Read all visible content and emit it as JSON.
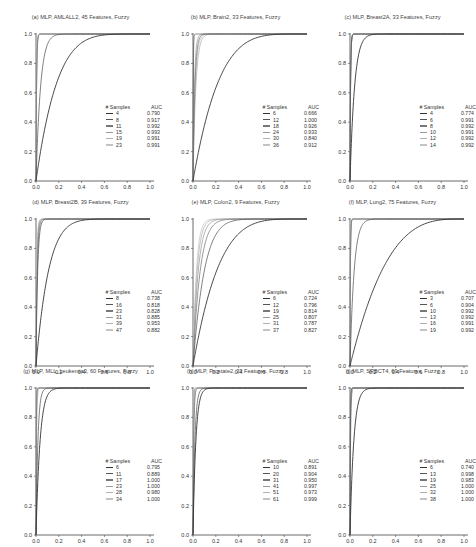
{
  "chart_data": [
    {
      "type": "line",
      "title": "(a) MLP, AMLALL2, 45 Features, Fuzzy",
      "xlabel": "",
      "ylabel": "",
      "xlim": [
        0,
        1
      ],
      "ylim": [
        0,
        1
      ],
      "xticks": [
        "0.0",
        "0.2",
        "0.4",
        "0.6",
        "0.8",
        "1.0"
      ],
      "yticks": [
        "0.0",
        "0.2",
        "0.4",
        "0.6",
        "0.8",
        "1.0"
      ],
      "grid": false,
      "legend_position": "lower right",
      "legend_header": {
        "samples": "# Samples",
        "auc": "AUC"
      },
      "series": [
        {
          "name": "4",
          "auc": "0.790",
          "k": 5.5
        },
        {
          "name": "8",
          "auc": "0.917",
          "k": 25
        },
        {
          "name": "11",
          "auc": "0.992",
          "k": 200
        },
        {
          "name": "15",
          "auc": "0.993",
          "k": 220
        },
        {
          "name": "19",
          "auc": "0.991",
          "k": 210
        },
        {
          "name": "23",
          "auc": "0.991",
          "k": 210
        }
      ]
    },
    {
      "type": "line",
      "title": "(b) MLP, Brain2, 33 Features, Fuzzy",
      "xlabel": "",
      "ylabel": "",
      "xlim": [
        0,
        1
      ],
      "ylim": [
        0,
        1
      ],
      "xticks": [
        "0.0",
        "0.2",
        "0.4",
        "0.6",
        "0.8",
        "1.0"
      ],
      "yticks": [
        "0.0",
        "0.2",
        "0.4",
        "0.6",
        "0.8",
        "1.0"
      ],
      "grid": false,
      "legend_position": "lower right",
      "legend_header": {
        "samples": "# Samples",
        "auc": "AUC"
      },
      "series": [
        {
          "name": "6",
          "auc": "0.666",
          "k": 4.5
        },
        {
          "name": "12",
          "auc": "1.000",
          "k": 400
        },
        {
          "name": "18",
          "auc": "0.926",
          "k": 60
        },
        {
          "name": "24",
          "auc": "0.933",
          "k": 80
        },
        {
          "name": "30",
          "auc": "0.840",
          "k": 40
        },
        {
          "name": "36",
          "auc": "0.912",
          "k": 50
        }
      ]
    },
    {
      "type": "line",
      "title": "(c) MLP, Breast2A, 33 Features, Fuzzy",
      "xlabel": "",
      "ylabel": "",
      "xlim": [
        0,
        1
      ],
      "ylim": [
        0,
        1
      ],
      "xticks": [
        "0.0",
        "0.2",
        "0.4",
        "0.6",
        "0.8",
        "1.0"
      ],
      "yticks": [
        "0.0",
        "0.2",
        "0.4",
        "0.6",
        "0.8",
        "1.0"
      ],
      "grid": false,
      "legend_position": "lower right",
      "legend_header": {
        "samples": "# Samples",
        "auc": "AUC"
      },
      "series": [
        {
          "name": "4",
          "auc": "0.774",
          "k": 25
        },
        {
          "name": "6",
          "auc": "0.991",
          "k": 210
        },
        {
          "name": "8",
          "auc": "0.992",
          "k": 220
        },
        {
          "name": "10",
          "auc": "0.991",
          "k": 210
        },
        {
          "name": "12",
          "auc": "0.992",
          "k": 220
        },
        {
          "name": "14",
          "auc": "0.992",
          "k": 220
        }
      ]
    },
    {
      "type": "line",
      "title": "(d) MLP, Breast2B, 39 Features, Fuzzy",
      "xlabel": "",
      "ylabel": "",
      "xlim": [
        0,
        1
      ],
      "ylim": [
        0,
        1
      ],
      "xticks": [
        "0.0",
        "0.2",
        "0.4",
        "0.6",
        "0.8",
        "1.0"
      ],
      "yticks": [
        "0.0",
        "0.2",
        "0.4",
        "0.6",
        "0.8",
        "1.0"
      ],
      "grid": false,
      "legend_position": "lower right",
      "legend_header": {
        "samples": "# Samples",
        "auc": "AUC"
      },
      "series": [
        {
          "name": "8",
          "auc": "0.738",
          "k": 9
        },
        {
          "name": "16",
          "auc": "0.818",
          "k": 70
        },
        {
          "name": "23",
          "auc": "0.828",
          "k": 90
        },
        {
          "name": "31",
          "auc": "0.885",
          "k": 110
        },
        {
          "name": "39",
          "auc": "0.953",
          "k": 130
        },
        {
          "name": "47",
          "auc": "0.882",
          "k": 150
        }
      ]
    },
    {
      "type": "line",
      "title": "(e) MLP, Colon2, 9 Features, Fuzzy",
      "xlabel": "",
      "ylabel": "",
      "xlim": [
        0,
        1
      ],
      "ylim": [
        0,
        1
      ],
      "xticks": [
        "0.0",
        "0.2",
        "0.4",
        "0.6",
        "0.8",
        "1.0"
      ],
      "yticks": [
        "0.0",
        "0.2",
        "0.4",
        "0.6",
        "0.8",
        "1.0"
      ],
      "grid": false,
      "legend_position": "lower right",
      "legend_header": {
        "samples": "# Samples",
        "auc": "AUC"
      },
      "series": [
        {
          "name": "6",
          "auc": "0.724",
          "k": 4.5
        },
        {
          "name": "12",
          "auc": "0.796",
          "k": 10
        },
        {
          "name": "19",
          "auc": "0.814",
          "k": 16
        },
        {
          "name": "25",
          "auc": "0.807",
          "k": 22
        },
        {
          "name": "31",
          "auc": "0.787",
          "k": 28
        },
        {
          "name": "37",
          "auc": "0.827",
          "k": 34
        }
      ]
    },
    {
      "type": "line",
      "title": "(f) MLP, Lung2, 75 Features, Fuzzy",
      "xlabel": "",
      "ylabel": "",
      "xlim": [
        0,
        1
      ],
      "ylim": [
        0,
        1
      ],
      "xticks": [
        "0.0",
        "0.2",
        "0.4",
        "0.6",
        "0.8",
        "1.0"
      ],
      "yticks": [
        "0.0",
        "0.2",
        "0.4",
        "0.6",
        "0.8",
        "1.0"
      ],
      "grid": false,
      "legend_position": "lower right",
      "legend_header": {
        "samples": "# Samples",
        "auc": "AUC"
      },
      "series": [
        {
          "name": "3",
          "auc": "0.707",
          "k": 3.2
        },
        {
          "name": "6",
          "auc": "0.904",
          "k": 28
        },
        {
          "name": "10",
          "auc": "0.992",
          "k": 300
        },
        {
          "name": "13",
          "auc": "0.992",
          "k": 300
        },
        {
          "name": "16",
          "auc": "0.991",
          "k": 290
        },
        {
          "name": "19",
          "auc": "0.992",
          "k": 300
        }
      ]
    },
    {
      "type": "line",
      "title": "(g) MLP, MLL_Leukemia3, 60 Features, Fuzzy",
      "xlabel": "",
      "ylabel": "",
      "xlim": [
        0,
        1
      ],
      "ylim": [
        0,
        1
      ],
      "xticks": [
        "0.0",
        "0.2",
        "0.4",
        "0.6",
        "0.8",
        "1.0"
      ],
      "yticks": [
        "0.0",
        "0.2",
        "0.4",
        "0.6",
        "0.8",
        "1.0"
      ],
      "grid": false,
      "legend_position": "lower right",
      "legend_header": {
        "samples": "# Samples",
        "auc": "AUC"
      },
      "series": [
        {
          "name": "6",
          "auc": "0.795",
          "k": 28
        },
        {
          "name": "11",
          "auc": "0.889",
          "k": 60
        },
        {
          "name": "17",
          "auc": "1.000",
          "k": 400
        },
        {
          "name": "23",
          "auc": "1.000",
          "k": 400
        },
        {
          "name": "28",
          "auc": "0.980",
          "k": 200
        },
        {
          "name": "34",
          "auc": "1.000",
          "k": 400
        }
      ]
    },
    {
      "type": "line",
      "title": "(h) MLP, Prostate2, 33 Features, Fuzzy",
      "xlabel": "",
      "ylabel": "",
      "xlim": [
        0,
        1
      ],
      "ylim": [
        0,
        1
      ],
      "xticks": [
        "0.0",
        "0.2",
        "0.4",
        "0.6",
        "0.8",
        "1.0"
      ],
      "yticks": [
        "0.0",
        "0.2",
        "0.4",
        "0.6",
        "0.8",
        "1.0"
      ],
      "grid": false,
      "legend_position": "lower right",
      "legend_header": {
        "samples": "# Samples",
        "auc": "AUC"
      },
      "series": [
        {
          "name": "10",
          "auc": "0.891",
          "k": 40
        },
        {
          "name": "20",
          "auc": "0.904",
          "k": 60
        },
        {
          "name": "31",
          "auc": "0.950",
          "k": 150
        },
        {
          "name": "41",
          "auc": "0.997",
          "k": 300
        },
        {
          "name": "51",
          "auc": "0.973",
          "k": 200
        },
        {
          "name": "61",
          "auc": "0.999",
          "k": 400
        }
      ]
    },
    {
      "type": "line",
      "title": "(i) MLP, SRBCT4, 69 Features, Fuzzy",
      "xlabel": "",
      "ylabel": "",
      "xlim": [
        0,
        1
      ],
      "ylim": [
        0,
        1
      ],
      "xticks": [
        "0.0",
        "0.2",
        "0.4",
        "0.6",
        "0.8",
        "1.0"
      ],
      "yticks": [
        "0.0",
        "0.2",
        "0.4",
        "0.6",
        "0.8",
        "1.0"
      ],
      "grid": false,
      "legend_position": "lower right",
      "legend_header": {
        "samples": "# Samples",
        "auc": "AUC"
      },
      "series": [
        {
          "name": "6",
          "auc": "0.740",
          "k": 30
        },
        {
          "name": "13",
          "auc": "0.998",
          "k": 350
        },
        {
          "name": "19",
          "auc": "0.983",
          "k": 200
        },
        {
          "name": "25",
          "auc": "1.000",
          "k": 400
        },
        {
          "name": "32",
          "auc": "1.000",
          "k": 400
        },
        {
          "name": "38",
          "auc": "1.000",
          "k": 400
        }
      ]
    }
  ],
  "style": {
    "series_colors": [
      "#333333",
      "#555555",
      "#777777",
      "#999999",
      "#b0b0b0",
      "#c4c4c4"
    ],
    "axis_color": "#444444",
    "text_color": "#333333"
  }
}
